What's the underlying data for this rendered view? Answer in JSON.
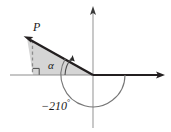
{
  "figure": {
    "labels": {
      "point_p": "P",
      "angle_alpha": "α",
      "angle_measure_value": "−210",
      "angle_measure_degree": "°"
    },
    "colors": {
      "ray_stroke": "#231f20",
      "axis_positive_x": "#231f20",
      "axis_gray": "#9a9a9a",
      "shaded_region": "#d4d4d4",
      "arc_stroke": "#6e6e6e",
      "dashed_stroke": "#8c8c8c",
      "background": "#ffffff"
    },
    "geometry": {
      "origin_x": 93,
      "origin_y": 75,
      "point_p_x": 27,
      "point_p_y": 38,
      "foot_x": 33,
      "foot_y": 75,
      "alpha_arc_radius": 28,
      "reference_arc_radius": 32,
      "x_axis_left_end": 10,
      "x_axis_right_end": 163,
      "y_axis_top_end": 8,
      "y_axis_bottom_end": 128
    }
  }
}
